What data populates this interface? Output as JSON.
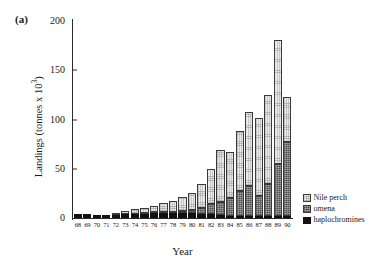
{
  "figure": {
    "panel_label": "(a)"
  },
  "axes": {
    "ylabel_main": "Landings (tonnes x 10",
    "ylabel_exp": "3",
    "ylabel_close": ")",
    "xlabel": "Year"
  },
  "legend": {
    "items": [
      {
        "label": "Nile perch",
        "swatch": "light-stipple-square",
        "color": "#e9e9e9"
      },
      {
        "label": "omena",
        "swatch": "gray-hatched-square",
        "color": "#a8a8a8"
      },
      {
        "label": "haplochromines",
        "swatch": "black-square",
        "color": "#111111"
      }
    ]
  },
  "chart_data": {
    "type": "bar",
    "stacked": true,
    "title": "",
    "xlabel": "Year",
    "ylabel": "Landings (tonnes x 10^3)",
    "ylim": [
      0,
      200
    ],
    "yticks": [
      0,
      50,
      100,
      150,
      200
    ],
    "ytick_labels": [
      "0",
      "50",
      "100",
      "150",
      "200"
    ],
    "grid": false,
    "legend_position": "right-bottom",
    "categories": [
      "68",
      "69",
      "70",
      "71",
      "72",
      "73",
      "74",
      "75",
      "76",
      "77",
      "78",
      "79",
      "80",
      "81",
      "82",
      "83",
      "84",
      "85",
      "86",
      "87",
      "88",
      "89",
      "90"
    ],
    "series": [
      {
        "name": "haplochromines",
        "color": "#111111",
        "values": [
          4,
          4,
          3,
          3,
          3,
          4,
          4,
          4,
          5,
          5,
          5,
          5,
          5,
          4,
          4,
          3,
          2,
          2,
          2,
          2,
          2,
          2,
          2
        ]
      },
      {
        "name": "omena",
        "color": "#a8a8a8",
        "values": [
          0,
          0,
          0,
          0,
          0,
          0,
          0,
          1,
          1,
          1,
          1,
          2,
          3,
          6,
          10,
          13,
          18,
          25,
          30,
          20,
          33,
          53,
          75
        ]
      },
      {
        "name": "Nile perch",
        "color": "#e9e9e9",
        "values": [
          0,
          0,
          0,
          0,
          1,
          3,
          5,
          5,
          6,
          9,
          11,
          14,
          17,
          25,
          36,
          53,
          47,
          61,
          76,
          80,
          90,
          126,
          46
        ]
      }
    ],
    "totals": [
      4,
      4,
      3,
      3,
      4,
      7,
      9,
      10,
      12,
      15,
      17,
      21,
      25,
      35,
      50,
      69,
      67,
      88,
      108,
      102,
      125,
      181,
      123
    ]
  }
}
